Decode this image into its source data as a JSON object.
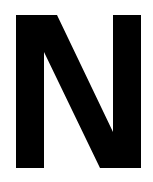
{
  "image": {
    "letter": "N",
    "foreground_color": "#000000",
    "background_color": "#ffffff"
  }
}
